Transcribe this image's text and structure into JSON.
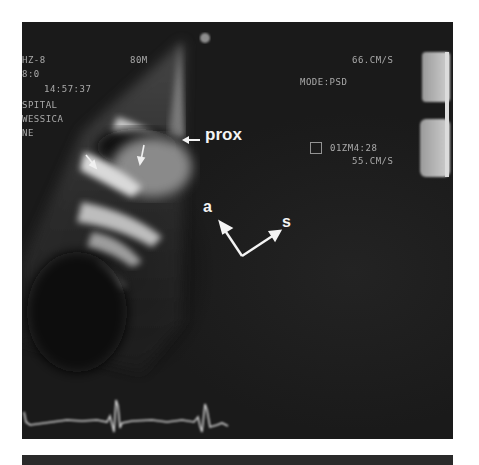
{
  "image": {
    "description": "Grayscale echocardiogram (ultrasound) frame with annotation arrows and ECG trace",
    "top_panel": {
      "overlay_text_left": [
        "HZ-8",
        "8:0",
        "14:57:37",
        "SPITAL",
        "WESSICA",
        "NE"
      ],
      "overlay_text_top_center": "80M",
      "overlay_text_right": {
        "scale_top": "66.CM/S",
        "mode": "MODE:PSD",
        "time_code": "01ZM4:28",
        "scale_bottom": "55.CM/S"
      },
      "annotations": {
        "prox_label": "prox",
        "axis_a_label": "a",
        "axis_s_label": "s"
      }
    },
    "colors": {
      "background": "#1e1e1e",
      "tissue_bright": "#d9d9d9",
      "blood_pool": "#8a8a8a",
      "annotation": "#f4f4f4",
      "page": "#ffffff"
    }
  }
}
